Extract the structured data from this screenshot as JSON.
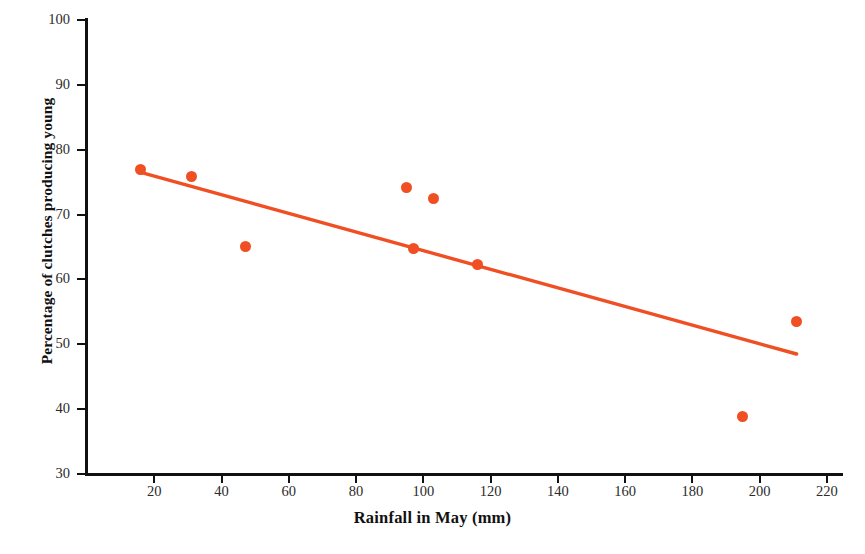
{
  "chart_data": {
    "type": "scatter",
    "title": "",
    "xlabel": "Rainfall in May (mm)",
    "ylabel": "Percentage of clutches producing young",
    "xlim": [
      0,
      222
    ],
    "ylim": [
      30,
      102
    ],
    "xticks": [
      20,
      40,
      60,
      80,
      100,
      120,
      140,
      160,
      180,
      200,
      220
    ],
    "yticks": [
      30,
      40,
      50,
      60,
      70,
      80,
      90,
      100
    ],
    "grid": false,
    "legend": "none",
    "marker_color": "#f04e23",
    "line_color": "#f04e23",
    "axis_color": "#111111",
    "points": [
      {
        "x": 16,
        "y": 77.0
      },
      {
        "x": 31,
        "y": 75.8
      },
      {
        "x": 47,
        "y": 65.0
      },
      {
        "x": 95,
        "y": 74.2
      },
      {
        "x": 97,
        "y": 64.7
      },
      {
        "x": 103,
        "y": 72.4
      },
      {
        "x": 116,
        "y": 62.3
      },
      {
        "x": 195,
        "y": 38.9
      },
      {
        "x": 211,
        "y": 53.5
      }
    ],
    "series": [
      {
        "name": "Clutch success vs rainfall",
        "x": [
          16,
          31,
          47,
          95,
          97,
          103,
          116,
          195,
          211
        ],
        "values": [
          77.0,
          75.8,
          65.0,
          74.2,
          64.7,
          72.4,
          62.3,
          38.9,
          53.5
        ]
      },
      {
        "name": "trend line",
        "type": "line",
        "x": [
          16,
          211
        ],
        "values": [
          76.5,
          48.5
        ]
      }
    ]
  }
}
